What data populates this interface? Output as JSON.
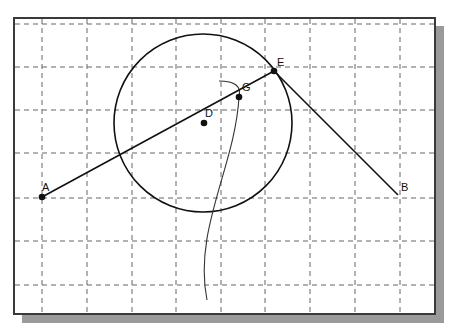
{
  "diagram": {
    "type": "geometry-construction",
    "frame": {
      "x": 13,
      "y": 17,
      "width": 421,
      "height": 296,
      "border_color": "#3a3a3a",
      "shadow_color": "#9a9a9a"
    },
    "grid": {
      "style": "dashed",
      "color": "#666666",
      "vertical_x": [
        42,
        87,
        132,
        176,
        221,
        265,
        310,
        355,
        400
      ],
      "horizontal_y": [
        24,
        67,
        110,
        153,
        198,
        241,
        285
      ]
    },
    "points": [
      {
        "id": "A",
        "label": "A",
        "x": 42,
        "y": 197,
        "marked": true
      },
      {
        "id": "B",
        "label": "B",
        "x": 398,
        "y": 195,
        "marked": false
      },
      {
        "id": "D",
        "label": "D",
        "x": 204,
        "y": 123,
        "marked": true
      },
      {
        "id": "G",
        "label": "G",
        "x": 239,
        "y": 97,
        "marked": true
      },
      {
        "id": "E",
        "label": "E",
        "x": 274,
        "y": 71,
        "marked": true
      }
    ],
    "segments": [
      {
        "from": "A",
        "to": "E"
      },
      {
        "from": "E",
        "to": "B"
      }
    ],
    "circle": {
      "center": "D",
      "cx": 203,
      "cy": 123,
      "r": 89
    },
    "curve": {
      "description": "freehand arc from above G sweeping through G and down to bottom",
      "start": [
        219,
        81
      ],
      "through": [
        239,
        97
      ],
      "end": [
        207,
        300
      ]
    }
  }
}
